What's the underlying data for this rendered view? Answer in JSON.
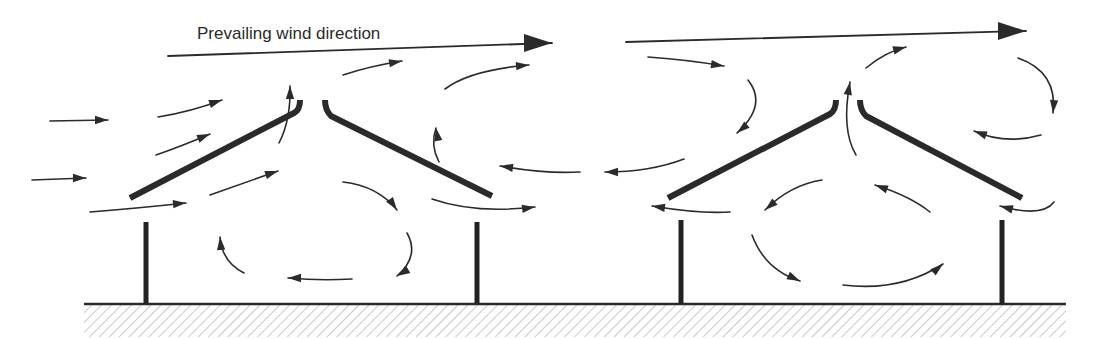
{
  "diagram": {
    "title_label": "Prevailing wind direction",
    "colors": {
      "ink": "#2b2b2b",
      "background": "#ffffff",
      "hatch": "#777777"
    },
    "ground": {
      "y": 304,
      "x_start": 84,
      "x_end": 1066,
      "hatch_depth": 32
    },
    "buildings": [
      {
        "name": "left-shelter",
        "roof_left": "M130,198 L294,113 Q300,110 300,100",
        "roof_right": "M325,100 Q325,110 331,116 L492,196",
        "posts": [
          {
            "x": 146,
            "y1": 222,
            "y2": 304
          },
          {
            "x": 477,
            "y1": 222,
            "y2": 304
          }
        ]
      },
      {
        "name": "right-shelter",
        "roof_left": "M668,198 L830,114 Q836,110 836,100",
        "roof_right": "M860,100 Q860,110 866,116 L1022,198",
        "posts": [
          {
            "x": 681,
            "y1": 220,
            "y2": 304
          },
          {
            "x": 1002,
            "y1": 220,
            "y2": 304
          }
        ]
      }
    ],
    "main_arrows": [
      {
        "d": "M168,56 L552,43",
        "head": [
          552,
          43,
          0
        ]
      },
      {
        "d": "M626,42 L1026,31",
        "head": [
          1026,
          31,
          0
        ]
      }
    ],
    "flow_arrows": [
      {
        "d": "M50,121 L108,120",
        "head": [
          108,
          120,
          0
        ]
      },
      {
        "d": "M32,180 L86,178",
        "head": [
          86,
          178,
          0
        ]
      },
      {
        "d": "M158,117 Q190,112 222,100",
        "head": [
          222,
          100,
          -18
        ]
      },
      {
        "d": "M156,155 Q182,146 210,134",
        "head": [
          210,
          134,
          -22
        ]
      },
      {
        "d": "M90,212 Q140,208 186,203",
        "head": [
          186,
          203,
          -5
        ]
      },
      {
        "d": "M210,195 L278,171",
        "head": [
          278,
          171,
          -18
        ]
      },
      {
        "d": "M279,143 Q291,120 290,86",
        "head": [
          290,
          86,
          -90
        ]
      },
      {
        "d": "M343,75 Q370,66 402,61",
        "head": [
          402,
          61,
          -10
        ]
      },
      {
        "d": "M343,182 Q378,186 397,210",
        "head": [
          397,
          210,
          55
        ]
      },
      {
        "d": "M407,233 Q420,256 397,276",
        "head": [
          397,
          276,
          150
        ]
      },
      {
        "d": "M352,279 Q320,281 288,278",
        "head": [
          288,
          278,
          180
        ]
      },
      {
        "d": "M244,273 Q222,262 220,237",
        "head": [
          220,
          237,
          -95
        ]
      },
      {
        "d": "M439,162 Q430,145 436,128",
        "head": [
          436,
          128,
          -100
        ]
      },
      {
        "d": "M445,89 Q470,70 529,65",
        "head": [
          529,
          65,
          -5
        ]
      },
      {
        "d": "M432,199 Q475,214 535,207",
        "head": [
          535,
          207,
          -8
        ]
      },
      {
        "d": "M580,172 Q545,174 500,166",
        "head": [
          500,
          166,
          188
        ]
      },
      {
        "d": "M684,159 Q650,172 605,172",
        "head": [
          605,
          172,
          180
        ]
      },
      {
        "d": "M648,57 Q690,60 724,66",
        "head": [
          724,
          66,
          8
        ]
      },
      {
        "d": "M748,80 Q768,105 737,133",
        "head": [
          737,
          133,
          140
        ]
      },
      {
        "d": "M730,212 Q700,214 652,206",
        "head": [
          652,
          206,
          188
        ]
      },
      {
        "d": "M822,180 Q790,185 765,210",
        "head": [
          765,
          210,
          140
        ]
      },
      {
        "d": "M752,235 Q765,270 800,281",
        "head": [
          800,
          281,
          25
        ]
      },
      {
        "d": "M843,285 Q900,292 943,264",
        "head": [
          943,
          264,
          -40
        ]
      },
      {
        "d": "M930,212 Q910,196 875,185",
        "head": [
          875,
          185,
          200
        ]
      },
      {
        "d": "M856,155 Q841,130 850,82",
        "head": [
          850,
          82,
          -80
        ]
      },
      {
        "d": "M866,68 Q885,52 906,47",
        "head": [
          906,
          47,
          -15
        ]
      },
      {
        "d": "M1018,58 Q1058,72 1053,113",
        "head": [
          1053,
          113,
          95
        ]
      },
      {
        "d": "M1041,135 Q1005,145 974,131",
        "head": [
          974,
          131,
          200
        ]
      },
      {
        "d": "M1054,202 Q1042,218 1000,206",
        "head": [
          1000,
          206,
          195
        ]
      }
    ]
  }
}
